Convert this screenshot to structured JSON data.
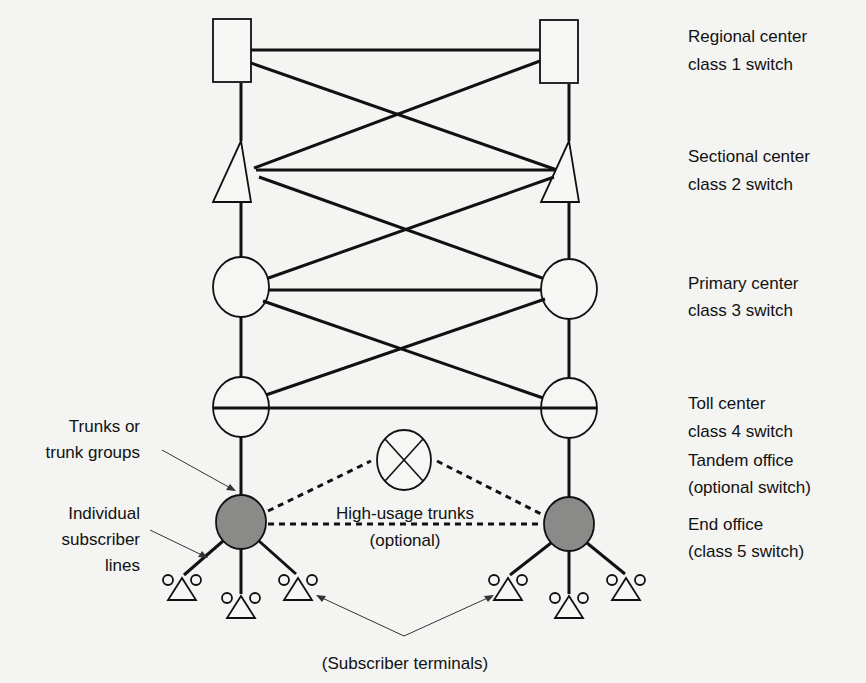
{
  "diagram": {
    "levels": [
      {
        "name": "Regional center",
        "sub": "class 1 switch",
        "shape": "square"
      },
      {
        "name": "Sectional center",
        "sub": "class 2 switch",
        "shape": "triangle"
      },
      {
        "name": "Primary center",
        "sub": "class 3 switch",
        "shape": "circle"
      },
      {
        "name": "Toll center",
        "sub": "class 4 switch",
        "shape": "circle"
      },
      {
        "name": "Tandem office",
        "sub": "(optional switch)",
        "shape": "circle-x"
      },
      {
        "name": "End office",
        "sub": "(class 5 switch)",
        "shape": "filled-circle"
      }
    ],
    "annotations": {
      "trunks_line1": "Trunks or",
      "trunks_line2": "trunk groups",
      "lines_line1": "Individual",
      "lines_line2": "subscriber",
      "lines_line3": "lines",
      "high_usage_line1": "High-usage trunks",
      "high_usage_line2": "(optional)",
      "terminals": "(Subscriber terminals)"
    },
    "colors": {
      "line": "#111111",
      "end_office_fill": "#8a8a88",
      "background": "#f4f4f2"
    }
  }
}
